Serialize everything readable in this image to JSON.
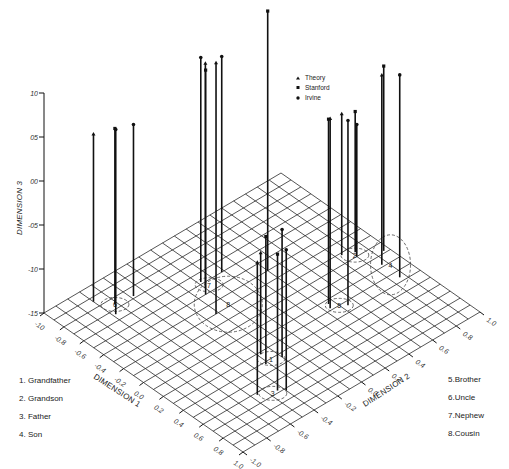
{
  "chart_data": {
    "type": "scatter",
    "subtype": "3d-stick-plot",
    "title": "",
    "axes": {
      "x": {
        "label": "DIMENSION 1",
        "range": [
          -1.0,
          1.0
        ],
        "ticks": [
          -1.0,
          -0.8,
          -0.6,
          -0.4,
          -0.2,
          0.0,
          0.2,
          0.4,
          0.6,
          0.8,
          1.0
        ],
        "tick_labels": [
          "-10",
          "-0.8",
          "-0.6",
          "-0.4",
          "-0.2",
          "0.0",
          "0.2",
          "0.4",
          "0.6",
          "0.8",
          "1.0"
        ]
      },
      "y": {
        "label": "DIMENSION 2",
        "range": [
          -1.0,
          1.0
        ],
        "ticks": [
          -1.0,
          -0.8,
          -0.6,
          -0.4,
          -0.2,
          0.0,
          0.2,
          0.4,
          0.6,
          0.8,
          1.0
        ],
        "tick_labels": [
          "-1.0",
          "-0.8",
          "-0.6",
          "-0.4",
          "-0.2",
          "0.0",
          "0.2",
          "0.4",
          "0.6",
          "0.8",
          "1.0"
        ]
      },
      "z": {
        "label": "DIMENSION 3",
        "range": [
          -1.5,
          1.0
        ],
        "ticks": [
          -1.5,
          -1.0,
          -0.5,
          0.0,
          0.5,
          1.0
        ],
        "tick_labels": [
          "-15",
          "-10",
          "-05",
          "00",
          "05",
          "10"
        ]
      }
    },
    "grid": true,
    "legend": {
      "placement": "top-center",
      "entries": [
        {
          "name": "Theory",
          "marker": "triangle"
        },
        {
          "name": "Stanford",
          "marker": "square"
        },
        {
          "name": "Irvine",
          "marker": "circle"
        }
      ]
    },
    "kin_terms": [
      {
        "id": 1,
        "name": "Grandfather"
      },
      {
        "id": 2,
        "name": "Grandson"
      },
      {
        "id": 3,
        "name": "Father"
      },
      {
        "id": 4,
        "name": "Son"
      },
      {
        "id": 5,
        "name": "Brother"
      },
      {
        "id": 6,
        "name": "Uncle"
      },
      {
        "id": 7,
        "name": "Nephew"
      },
      {
        "id": 8,
        "name": "Cousin"
      }
    ],
    "points": [
      {
        "term": 6,
        "series": "Theory",
        "x": -0.86,
        "y": -0.7,
        "z": 0.4
      },
      {
        "term": 6,
        "series": "Stanford",
        "x": -0.74,
        "y": -0.62,
        "z": 0.5
      },
      {
        "term": 6,
        "series": "Irvine",
        "x": -0.66,
        "y": -0.68,
        "z": 0.6
      },
      {
        "term": 6,
        "series": "Irvine",
        "x": -0.72,
        "y": -0.48,
        "z": 0.45
      },
      {
        "term": 7,
        "series": "Theory",
        "x": -0.45,
        "y": -0.1,
        "z": 1.05
      },
      {
        "term": 7,
        "series": "Stanford",
        "x": -0.4,
        "y": -0.14,
        "z": 1.05
      },
      {
        "term": 7,
        "series": "Irvine",
        "x": -0.52,
        "y": -0.08,
        "z": 1.05
      },
      {
        "term": 7,
        "series": "Irvine",
        "x": -0.5,
        "y": 0.08,
        "z": 0.95
      },
      {
        "term": 8,
        "series": "Theory",
        "x": -0.2,
        "y": -0.22,
        "z": 1.35
      },
      {
        "term": 8,
        "series": "Stanford",
        "x": -0.3,
        "y": 0.3,
        "z": 1.45
      },
      {
        "term": 1,
        "series": "Theory",
        "x": 0.32,
        "y": -0.28,
        "z": -0.35
      },
      {
        "term": 1,
        "series": "Stanford",
        "x": 0.42,
        "y": -0.32,
        "z": -0.05
      },
      {
        "term": 1,
        "series": "Irvine",
        "x": 0.44,
        "y": -0.2,
        "z": -0.05
      },
      {
        "term": 3,
        "series": "Theory",
        "x": 0.62,
        "y": -0.56,
        "z": 0.0
      },
      {
        "term": 3,
        "series": "Stanford",
        "x": 0.68,
        "y": -0.44,
        "z": 0.05
      },
      {
        "term": 3,
        "series": "Irvine",
        "x": 0.72,
        "y": -0.4,
        "z": 0.1
      },
      {
        "term": 5,
        "series": "Theory",
        "x": 0.28,
        "y": 0.34,
        "z": 0.65
      },
      {
        "term": 5,
        "series": "Stanford",
        "x": 0.24,
        "y": 0.36,
        "z": 0.6
      },
      {
        "term": 5,
        "series": "Irvine",
        "x": 0.34,
        "y": 0.44,
        "z": 0.6
      },
      {
        "term": 2,
        "series": "Theory",
        "x": -0.08,
        "y": 0.74,
        "z": 0.1
      },
      {
        "term": 2,
        "series": "Stanford",
        "x": -0.04,
        "y": 0.82,
        "z": 0.1
      },
      {
        "term": 2,
        "series": "Irvine",
        "x": 0.0,
        "y": 0.8,
        "z": 0.0
      },
      {
        "term": 4,
        "series": "Theory",
        "x": 0.18,
        "y": 0.86,
        "z": 0.65
      },
      {
        "term": 4,
        "series": "Stanford",
        "x": 0.08,
        "y": 0.96,
        "z": 0.6
      },
      {
        "term": 4,
        "series": "Irvine",
        "x": 0.36,
        "y": 0.86,
        "z": 0.8
      }
    ],
    "clusters": [
      {
        "label": "1",
        "x": 0.4,
        "y": -0.26
      },
      {
        "label": "2",
        "x": -0.02,
        "y": 0.8
      },
      {
        "label": "3",
        "x": 0.68,
        "y": -0.48
      },
      {
        "label": "4",
        "x": 0.22,
        "y": 0.9
      },
      {
        "label": "5",
        "x": 0.3,
        "y": 0.4
      },
      {
        "label": "6",
        "x": -0.74,
        "y": -0.62
      },
      {
        "label": "7",
        "x": -0.46,
        "y": -0.06
      },
      {
        "label": "8",
        "x": -0.22,
        "y": -0.1
      }
    ]
  }
}
